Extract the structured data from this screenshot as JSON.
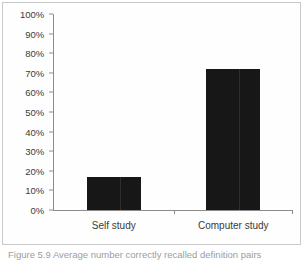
{
  "figure": {
    "caption": "Figure 5.9  Average number correctly recalled definition pairs",
    "frame_color": "#c9c9c9",
    "background_color": "#ffffff"
  },
  "chart_data": {
    "type": "bar",
    "title": "",
    "subtitle": "",
    "xlabel": "",
    "ylabel": "",
    "categories": [
      "Self study",
      "Computer study"
    ],
    "values": [
      17,
      72
    ],
    "value_suffix": "%",
    "ylim": [
      0,
      100
    ],
    "ytick_values": [
      0,
      10,
      20,
      30,
      40,
      50,
      60,
      70,
      80,
      90,
      100
    ],
    "ytick_labels": [
      "0%",
      "10%",
      "20%",
      "30%",
      "40%",
      "50%",
      "60%",
      "70%",
      "80%",
      "90%",
      "100%"
    ],
    "grid": false,
    "legend": false,
    "legend_position": "none",
    "bar_color": "#171717",
    "axis_color": "#8c8c8c",
    "tick_label_color": "#3a3a3a"
  }
}
